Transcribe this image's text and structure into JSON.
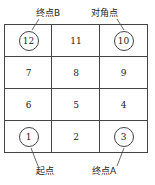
{
  "diagram": {
    "grid": [
      [
        {
          "n": "12",
          "circled": true
        },
        {
          "n": "11",
          "circled": false
        },
        {
          "n": "10",
          "circled": true
        }
      ],
      [
        {
          "n": "7",
          "circled": false
        },
        {
          "n": "8",
          "circled": false
        },
        {
          "n": "9",
          "circled": false
        }
      ],
      [
        {
          "n": "6",
          "circled": false
        },
        {
          "n": "5",
          "circled": false
        },
        {
          "n": "4",
          "circled": false
        }
      ],
      [
        {
          "n": "1",
          "circled": true
        },
        {
          "n": "2",
          "circled": false
        },
        {
          "n": "3",
          "circled": true
        }
      ]
    ],
    "labels": {
      "end_b": "终点B",
      "diagonal": "对角点",
      "start": "起点",
      "end_a": "终点A"
    }
  }
}
